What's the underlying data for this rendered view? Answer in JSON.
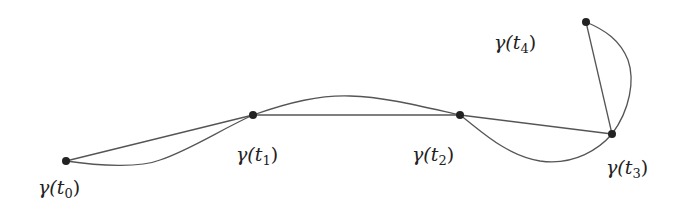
{
  "diagram": {
    "type": "piecewise-geodesic-path",
    "colors": {
      "stroke": "#555555",
      "point": "#222222",
      "text": "#222222",
      "background": "#ffffff"
    },
    "points": [
      {
        "id": "t0",
        "x": 66,
        "y": 161,
        "label_fn": "γ(",
        "label_var": "t",
        "label_sub": "0",
        "label_close": ")",
        "lx": 38,
        "ly": 194
      },
      {
        "id": "t1",
        "x": 253,
        "y": 115,
        "label_fn": "γ(",
        "label_var": "t",
        "label_sub": "1",
        "label_close": ")",
        "lx": 236,
        "ly": 161
      },
      {
        "id": "t2",
        "x": 460,
        "y": 115,
        "label_fn": "γ(",
        "label_var": "t",
        "label_sub": "2",
        "label_close": ")",
        "lx": 412,
        "ly": 161
      },
      {
        "id": "t3",
        "x": 612,
        "y": 134,
        "label_fn": "γ(",
        "label_var": "t",
        "label_sub": "3",
        "label_close": ")",
        "lx": 606,
        "ly": 174
      },
      {
        "id": "t4",
        "x": 586,
        "y": 22,
        "label_fn": "γ(",
        "label_var": "t",
        "label_sub": "4",
        "label_close": ")",
        "lx": 494,
        "ly": 49
      }
    ],
    "straight_segments": [
      [
        "t0",
        "t1"
      ],
      [
        "t1",
        "t2"
      ],
      [
        "t2",
        "t3"
      ],
      [
        "t3",
        "t4"
      ]
    ],
    "curved_segments": [
      [
        "t0",
        "t1"
      ],
      [
        "t1",
        "t2"
      ],
      [
        "t2",
        "t3"
      ],
      [
        "t3",
        "t4"
      ]
    ]
  }
}
